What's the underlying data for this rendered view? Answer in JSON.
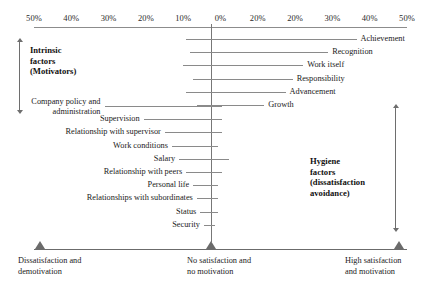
{
  "chart_data": {
    "type": "bar",
    "orientation": "horizontal-diverging",
    "xlabel": "Percentage frequency",
    "ylabel": "",
    "grid": false,
    "legend_position": "none",
    "zero_label": "0%",
    "axis_ticks": [
      {
        "label": "50%",
        "x_pct": 920
      },
      {
        "label": "40%",
        "x_pct": 1000
      },
      {
        "label": "30%",
        "x_pct": 1080
      },
      {
        "label": "20%",
        "x_pct": 1160
      },
      {
        "label": "10%",
        "x_pct": 1240
      },
      {
        "label": "0%",
        "x_pct": 1320
      },
      {
        "label": "20%",
        "x_pct": 1400
      },
      {
        "label": "20%",
        "x_pct": 1480
      },
      {
        "label": "30%",
        "x_pct": 1560
      },
      {
        "label": "40%",
        "x_pct": 1640
      },
      {
        "label": "50%",
        "x_pct": 1720
      }
    ],
    "series": [
      {
        "name": "Intrinsic factors (Motivators)",
        "direction": "right",
        "categories": [
          "Achievement",
          "Recognition",
          "Work itself",
          "Responsibility",
          "Advancement",
          "Growth"
        ],
        "values": [
          41,
          33,
          26,
          23,
          21,
          15
        ],
        "negative_values": [
          7,
          6,
          8,
          5,
          7,
          4
        ]
      },
      {
        "name": "Hygiene factors (dissatisfaction avoidance)",
        "direction": "left",
        "categories": [
          "Company policy and administration",
          "Supervision",
          "Relationship with supervisor",
          "Work conditions",
          "Salary",
          "Relationship with peers",
          "Personal life",
          "Relationships with subordinates",
          "Status",
          "Security"
        ],
        "values": [
          30,
          19,
          13,
          11,
          9,
          7,
          5,
          4,
          3,
          2
        ],
        "positive_values": [
          3,
          3,
          3,
          2,
          5,
          3,
          2,
          2,
          2,
          1
        ]
      }
    ]
  },
  "axis": {
    "ticks": [
      "50%",
      "40%",
      "30%",
      "20%",
      "10%",
      "0%",
      "20%",
      "20%",
      "30%",
      "40%",
      "50%"
    ]
  },
  "groups": {
    "motivators": {
      "caption": "Intrinsic\nfactors\n(Motivators)"
    },
    "hygiene": {
      "caption": "Hygiene\nfactors\n(dissatisfaction\navoidance)"
    }
  },
  "bars": {
    "motivators": [
      {
        "label": "Achievement"
      },
      {
        "label": "Recognition"
      },
      {
        "label": "Work itself"
      },
      {
        "label": "Responsibility"
      },
      {
        "label": "Advancement"
      },
      {
        "label": "Growth"
      }
    ],
    "hygiene": [
      {
        "label": "Company policy and administration"
      },
      {
        "label": "Supervision"
      },
      {
        "label": "Relationship with supervisor"
      },
      {
        "label": "Work conditions"
      },
      {
        "label": "Salary"
      },
      {
        "label": "Relationship with peers"
      },
      {
        "label": "Personal life"
      },
      {
        "label": "Relationships with subordinates"
      },
      {
        "label": "Status"
      },
      {
        "label": "Security"
      }
    ]
  },
  "continuum": {
    "left": "Dissatisfaction and\ndemotivation",
    "center": "No satisfaction and\nno motivation",
    "right": "High satisfaction\nand motivation"
  },
  "colors": {
    "bar": "#8a8a8a",
    "axis": "#8c8c8c",
    "marker": "#6b6b6b",
    "text": "#1a1a1a",
    "background": "#ffffff"
  }
}
